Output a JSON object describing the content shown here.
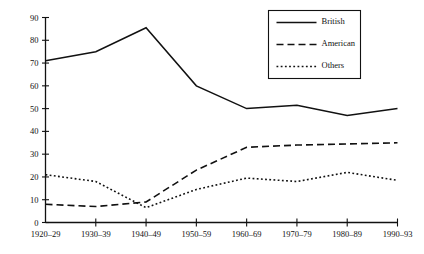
{
  "chart_data": {
    "type": "line",
    "title": "",
    "xlabel": "",
    "ylabel": "",
    "ylim": [
      0,
      90
    ],
    "ytick_step": 10,
    "grid": false,
    "legend_position": "upper-right",
    "categories": [
      "1920–29",
      "1930–39",
      "1940–49",
      "1950–59",
      "1960–69",
      "1970–79",
      "1980–89",
      "1990–93"
    ],
    "ytick_labels": [
      "0",
      "10",
      "20",
      "30",
      "40",
      "50",
      "60",
      "70",
      "80",
      "90"
    ],
    "series": [
      {
        "name": "British",
        "style": "solid",
        "color": "#111111",
        "values": [
          71,
          75,
          85.5,
          60,
          50,
          51.5,
          47,
          50
        ]
      },
      {
        "name": "American",
        "style": "dashed",
        "color": "#111111",
        "values": [
          8,
          7,
          9,
          23,
          33,
          34,
          34.5,
          35
        ]
      },
      {
        "name": "Others",
        "style": "dotted",
        "color": "#111111",
        "values": [
          21,
          18,
          6.5,
          14.5,
          19.5,
          18,
          22,
          18.5
        ]
      }
    ]
  },
  "legend": {
    "entries": [
      {
        "label": "British",
        "style": "solid"
      },
      {
        "label": "American",
        "style": "dashed"
      },
      {
        "label": "Others",
        "style": "dotted"
      }
    ]
  }
}
